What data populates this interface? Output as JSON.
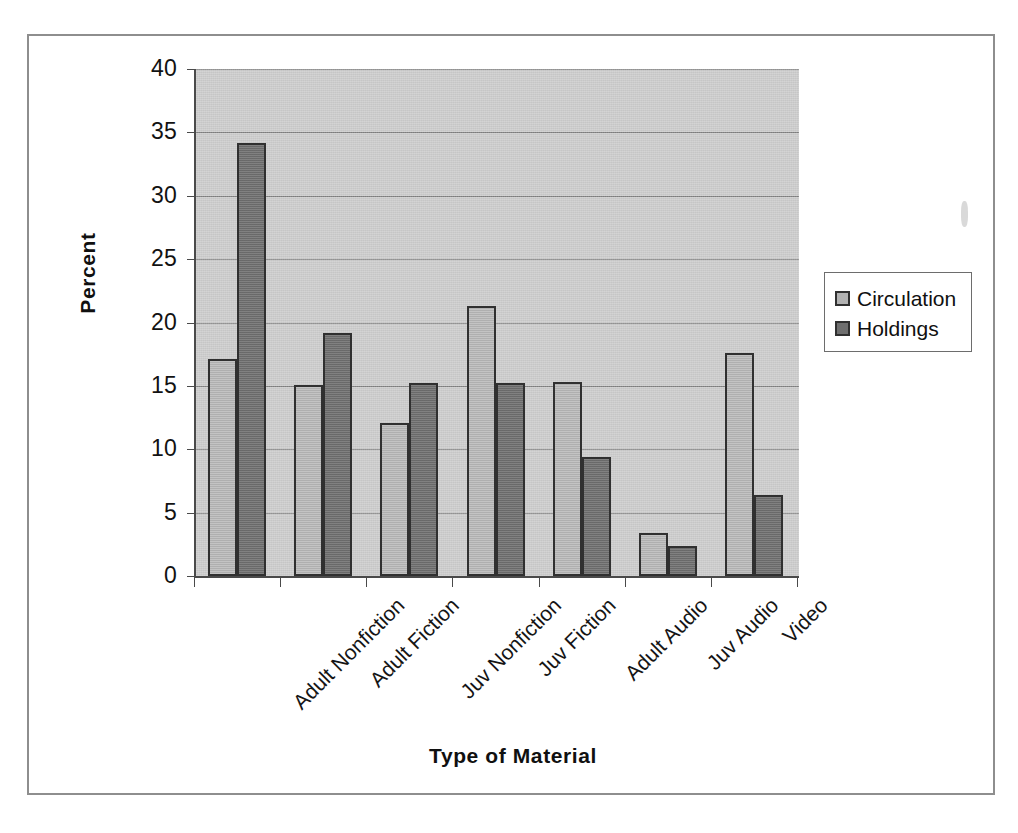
{
  "chart_data": {
    "type": "bar",
    "title": "",
    "xlabel": "Type of Material",
    "ylabel": "Percent",
    "categories": [
      "Adult Nonfiction",
      "Adult Fiction",
      "Juv Nonfiction",
      "Juv Fiction",
      "Adult Audio",
      "Juv Audio",
      "Video"
    ],
    "series": [
      {
        "name": "Circulation",
        "color": "#b2b2b2",
        "values": [
          17.1,
          15.1,
          12.1,
          21.3,
          15.3,
          3.4,
          17.6
        ]
      },
      {
        "name": "Holdings",
        "color": "#6f6f6f",
        "values": [
          34.2,
          19.2,
          15.2,
          15.2,
          9.4,
          2.4,
          6.4
        ]
      }
    ],
    "ylim": [
      0,
      40
    ],
    "yticks": [
      0,
      5,
      10,
      15,
      20,
      25,
      30,
      35,
      40
    ],
    "ytick_labels": [
      "0",
      "5",
      "10",
      "15",
      "20",
      "25",
      "30",
      "35",
      "40"
    ],
    "grid": true,
    "grid_axis": "y",
    "legend_position": "right",
    "plot_background": "#c6c6c6",
    "category_label_rotation": -45
  },
  "legend": {
    "entries": [
      {
        "label": "Circulation",
        "swatch": "#b2b2b2"
      },
      {
        "label": "Holdings",
        "swatch": "#6f6f6f"
      }
    ]
  },
  "axes": {
    "y_title": "Percent",
    "x_title": "Type of Material"
  }
}
